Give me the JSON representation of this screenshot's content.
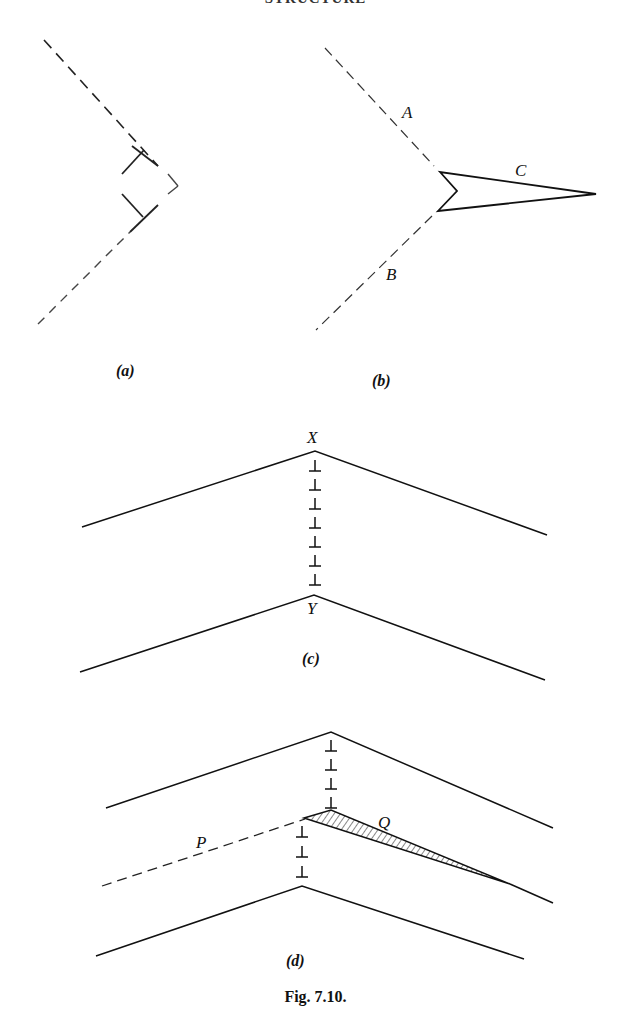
{
  "header": {
    "running_title": "STRUCTURE"
  },
  "panels": {
    "a": {
      "label": "(a)"
    },
    "b": {
      "label": "(b)",
      "labels": {
        "upper_dashed": "A",
        "lower_dashed": "B",
        "wedge": "C"
      }
    },
    "c": {
      "label": "(c)",
      "labels": {
        "top_apex": "X",
        "bottom_apex": "Y"
      },
      "dislocation_symbols": 7
    },
    "d": {
      "label": "(d)",
      "labels": {
        "dashed_line": "P",
        "hatched_wedge": "Q"
      },
      "dislocation_symbols_upper": 4,
      "dislocation_symbols_lower": 3
    }
  },
  "caption": "Fig. 7.10.",
  "colors": {
    "ink": "#111111",
    "background": "#ffffff"
  }
}
